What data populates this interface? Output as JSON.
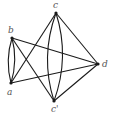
{
  "diagram": {
    "type": "multigraph",
    "vertices": [
      {
        "id": "c_top",
        "label": "c"
      },
      {
        "id": "b",
        "label": "b"
      },
      {
        "id": "a",
        "label": "a"
      },
      {
        "id": "c_bottom",
        "label": "c'"
      },
      {
        "id": "d",
        "label": "d"
      }
    ],
    "edges": [
      {
        "from": "a",
        "to": "b",
        "kind": "arc-left"
      },
      {
        "from": "a",
        "to": "b",
        "kind": "arc-right"
      },
      {
        "from": "c_top",
        "to": "c_bottom",
        "kind": "arc-left"
      },
      {
        "from": "c_top",
        "to": "c_bottom",
        "kind": "arc-right"
      },
      {
        "from": "c_top",
        "to": "a",
        "kind": "straight"
      },
      {
        "from": "c_top",
        "to": "d",
        "kind": "straight"
      },
      {
        "from": "c_bottom",
        "to": "b",
        "kind": "straight"
      },
      {
        "from": "c_bottom",
        "to": "d",
        "kind": "straight"
      },
      {
        "from": "b",
        "to": "d",
        "kind": "straight"
      },
      {
        "from": "a",
        "to": "d",
        "kind": "straight"
      }
    ]
  }
}
